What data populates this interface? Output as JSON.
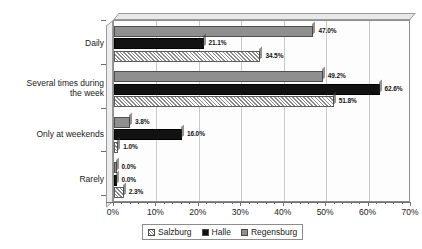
{
  "chart_data": {
    "type": "bar",
    "orientation": "horizontal",
    "title": "",
    "subtitle": "",
    "xlabel": "",
    "ylabel": "",
    "xlim": [
      0,
      70
    ],
    "grid": true,
    "legend_position": "bottom",
    "categories": [
      "Daily",
      "Several times during\nthe week",
      "Only at weekends",
      "Rarely"
    ],
    "series": [
      {
        "name": "Salzburg",
        "color": "#f2f2f2",
        "pattern": "diagonal-hatch",
        "values": [
          34.5,
          51.8,
          1.0,
          2.3
        ],
        "labels": [
          "34.5%",
          "51.8%",
          "1.0%",
          "2.3%"
        ]
      },
      {
        "name": "Halle",
        "color": "#121212",
        "pattern": "solid",
        "values": [
          21.1,
          62.6,
          16.0,
          0.0
        ],
        "labels": [
          "21.1%",
          "62.6%",
          "16.0%",
          "0.0%"
        ]
      },
      {
        "name": "Regensburg",
        "color": "#8f8f8f",
        "pattern": "solid",
        "values": [
          47.0,
          49.2,
          3.8,
          0.0
        ],
        "labels": [
          "47.0%",
          "49.2%",
          "3.8%",
          "0.0%"
        ]
      }
    ],
    "xticks": [
      {
        "value": 0,
        "label": "0%"
      },
      {
        "value": 10,
        "label": "10%"
      },
      {
        "value": 20,
        "label": "20%"
      },
      {
        "value": 30,
        "label": "30%"
      },
      {
        "value": 40,
        "label": "40%"
      },
      {
        "value": 50,
        "label": "50%"
      },
      {
        "value": 60,
        "label": "60%"
      },
      {
        "value": 70,
        "label": "70%"
      }
    ]
  },
  "legend": {
    "items": [
      {
        "label": "Salzburg"
      },
      {
        "label": "Halle"
      },
      {
        "label": "Regensburg"
      }
    ]
  }
}
